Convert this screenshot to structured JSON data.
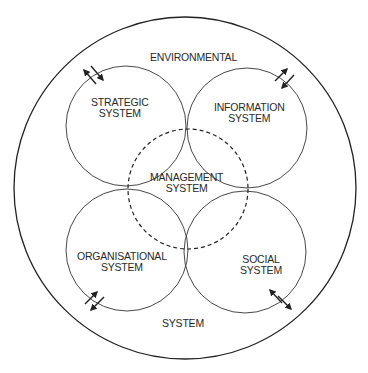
{
  "diagram": {
    "outer_label_top": "ENVIRONMENTAL",
    "outer_label_bottom": "SYSTEM",
    "systems": [
      {
        "id": "strategic",
        "line1": "STRATEGIC",
        "line2": "SYSTEM"
      },
      {
        "id": "information",
        "line1": "INFORMATION",
        "line2": "SYSTEM"
      },
      {
        "id": "management",
        "line1": "MANAGEMENT",
        "line2": "SYSTEM",
        "style": "dashed"
      },
      {
        "id": "organisational",
        "line1": "ORGANISATIONAL",
        "line2": "SYSTEM"
      },
      {
        "id": "social",
        "line1": "SOCIAL",
        "line2": "SYSTEM"
      }
    ],
    "exchange_arrows": [
      {
        "between": "strategic-environment",
        "icon": "bidirectional-arrow-icon"
      },
      {
        "between": "information-environment",
        "icon": "bidirectional-arrow-icon"
      },
      {
        "between": "organisational-environment",
        "icon": "bidirectional-arrow-icon"
      },
      {
        "between": "social-environment",
        "icon": "bidirectional-arrow-icon"
      }
    ],
    "colors": {
      "line": "#2a2a2a",
      "background": "#ffffff"
    }
  }
}
